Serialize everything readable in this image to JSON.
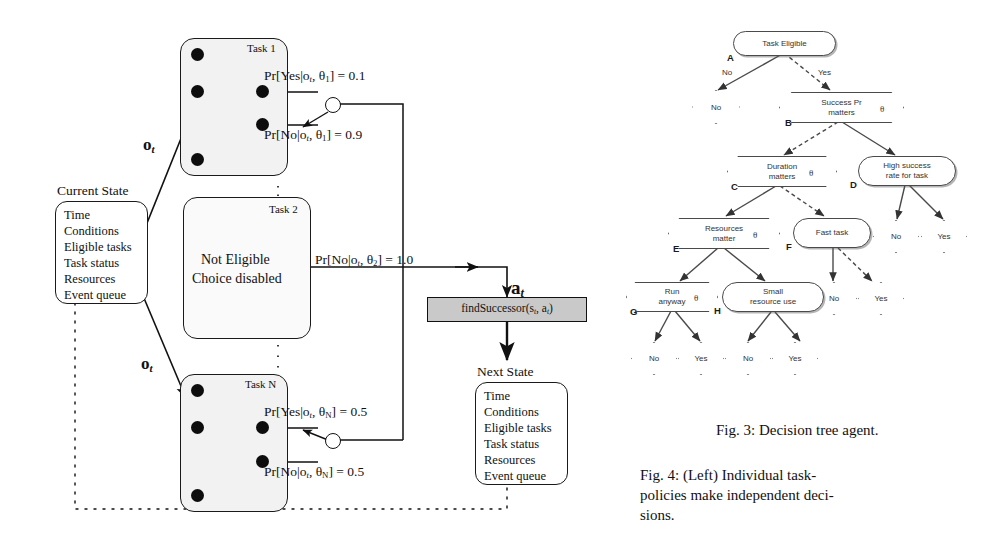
{
  "figure_left": {
    "current_state": {
      "caption": "Current State",
      "items": [
        "Time",
        "Conditions",
        "Eligible tasks",
        "Task status",
        "Resources",
        "Event queue"
      ]
    },
    "next_state": {
      "caption": "Next State",
      "items": [
        "Time",
        "Conditions",
        "Eligible tasks",
        "Task status",
        "Resources",
        "Event queue"
      ]
    },
    "observation_label_top": "o",
    "observation_sub": "t",
    "observation_label_bottom": "o",
    "action_label": "a",
    "action_sub": "t",
    "find_successor": "findSuccessor(s",
    "find_successor_sub1": "t",
    "find_successor_mid": ", a",
    "find_successor_sub2": "t",
    "find_successor_end": ")",
    "tasks": [
      {
        "title": "Task 1",
        "yes_eq": "Pr[Yes|o",
        "yes_sub": "t",
        "yes_theta": ", θ",
        "yes_theta_sub": "1",
        "yes_close": "] = 0.1",
        "no_eq": "Pr[No|o",
        "no_sub": "t",
        "no_theta": ", θ",
        "no_theta_sub": "1",
        "no_close": "] = 0.9"
      },
      {
        "title": "Task 2",
        "line1": "Not Eligible",
        "line2": "Choice disabled",
        "no_eq": "Pr[No|o",
        "no_sub": "t",
        "no_theta": ", θ",
        "no_theta_sub": "2",
        "no_close": "] = 1.0"
      },
      {
        "title": "Task N",
        "yes_eq": "Pr[Yes|o",
        "yes_sub": "t",
        "yes_theta": ", θ",
        "yes_theta_sub": "N",
        "yes_close": "] = 0.5",
        "no_eq": "Pr[No|o",
        "no_sub": "t",
        "no_theta": ", θ",
        "no_theta_sub": "N",
        "no_close": "] = 0.5"
      }
    ]
  },
  "decision_tree": {
    "nodes": [
      {
        "key": "A",
        "label": "Task Eligible",
        "shape": "round"
      },
      {
        "key": "B",
        "label": "Success Pr\nmatters",
        "shape": "hex",
        "theta": "θ"
      },
      {
        "key": "C",
        "label": "Duration\nmatters",
        "shape": "hex",
        "theta": "θ"
      },
      {
        "key": "D",
        "label": "High success\nrate for task",
        "shape": "round"
      },
      {
        "key": "E",
        "label": "Resources\nmatter",
        "shape": "hex",
        "theta": "θ"
      },
      {
        "key": "F",
        "label": "Fast task",
        "shape": "round"
      },
      {
        "key": "G",
        "label": "Run\nanyway",
        "shape": "hex",
        "theta": "θ"
      },
      {
        "key": "H",
        "label": "Small\nresource use",
        "shape": "round"
      }
    ],
    "edge_labels": {
      "no": "No",
      "yes": "Yes"
    },
    "leaves": [
      "No",
      "No",
      "Yes",
      "No",
      "Yes",
      "No",
      "Yes",
      "No",
      "Yes"
    ]
  },
  "captions": {
    "fig3": "Fig. 3: Decision tree agent.",
    "fig4_line1": "Fig. 4:    (Left) Individual task-",
    "fig4_line2": "policies  make  independent  deci-",
    "fig4_line3": "sions."
  },
  "colors": {
    "ink": "#111111",
    "task_fill": "#f2f2f2",
    "findsuccessor_fill": "#c9c9c9",
    "tree_stroke": "#4a4a4a"
  }
}
